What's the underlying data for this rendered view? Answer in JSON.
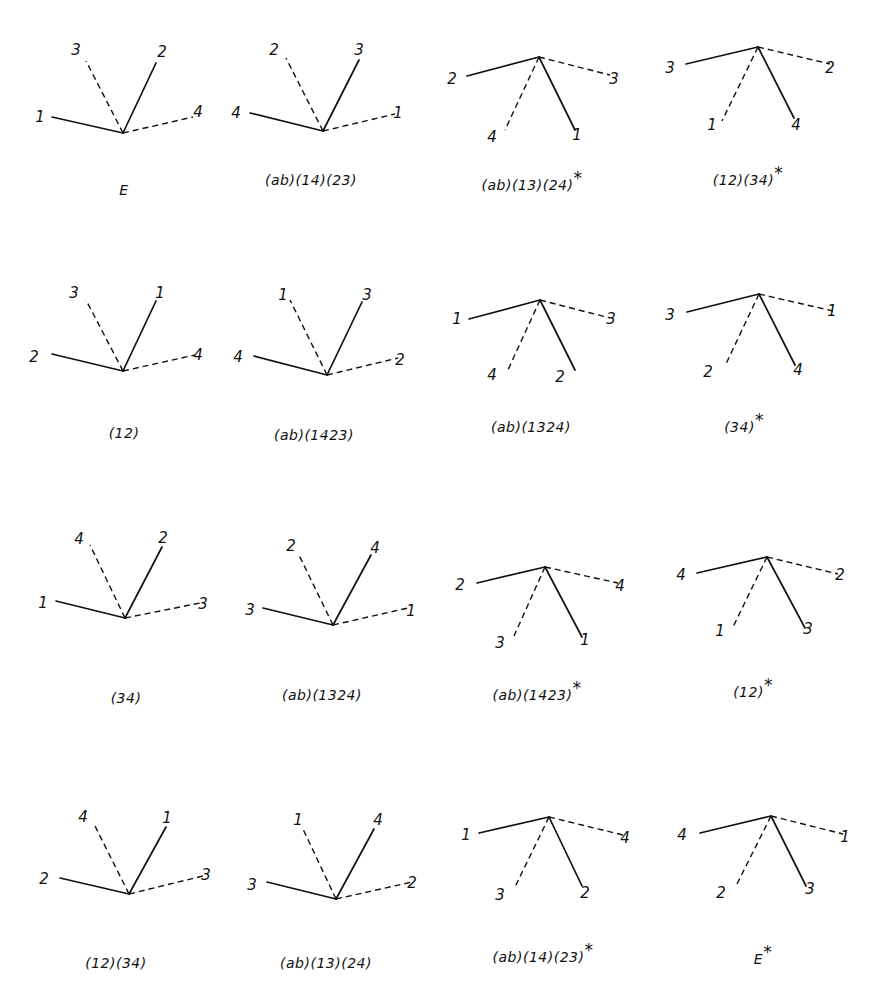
{
  "figure": {
    "layout": {
      "rows": 4,
      "cols": 4
    },
    "panels": [
      {
        "caption": "E",
        "star": false,
        "shape": "V",
        "vx": 123,
        "vy": 133,
        "arms": [
          {
            "label": "1",
            "style": "solid",
            "x": 52,
            "y": 117,
            "lx": 40,
            "ly": 122
          },
          {
            "label": "3",
            "style": "dash",
            "x": 86,
            "y": 61,
            "lx": 76,
            "ly": 55
          },
          {
            "label": "2",
            "style": "solid",
            "x": 156,
            "y": 63,
            "lx": 162,
            "ly": 57
          },
          {
            "label": "4",
            "style": "dash",
            "x": 193,
            "y": 117,
            "lx": 198,
            "ly": 117
          }
        ],
        "cx": 124,
        "cy": 195
      },
      {
        "caption": "(ab)(14)(23)",
        "star": false,
        "shape": "V",
        "vx": 323,
        "vy": 131,
        "arms": [
          {
            "label": "4",
            "style": "solid",
            "x": 250,
            "y": 113,
            "lx": 236,
            "ly": 118
          },
          {
            "label": "2",
            "style": "dash",
            "x": 286,
            "y": 58,
            "lx": 274,
            "ly": 55
          },
          {
            "label": "3",
            "style": "solid",
            "x": 359,
            "y": 60,
            "lx": 359,
            "ly": 55
          },
          {
            "label": "1",
            "style": "dash",
            "x": 395,
            "y": 114,
            "lx": 398,
            "ly": 118
          }
        ],
        "cx": 311,
        "cy": 185
      },
      {
        "caption": "(ab)(13)(24)",
        "star": true,
        "shape": "L",
        "vx": 539,
        "vy": 57,
        "arms": [
          {
            "label": "2",
            "style": "solid",
            "x": 467,
            "y": 76,
            "lx": 452,
            "ly": 84
          },
          {
            "label": "3",
            "style": "dash",
            "x": 610,
            "y": 75,
            "lx": 614,
            "ly": 84
          },
          {
            "label": "4",
            "style": "dash",
            "x": 505,
            "y": 130,
            "lx": 492,
            "ly": 142
          },
          {
            "label": "1",
            "style": "solid",
            "x": 575,
            "y": 130,
            "lx": 577,
            "ly": 140
          }
        ],
        "cx": 532,
        "cy": 190
      },
      {
        "caption": "(12)(34)",
        "star": true,
        "shape": "L",
        "vx": 758,
        "vy": 47,
        "arms": [
          {
            "label": "3",
            "style": "solid",
            "x": 686,
            "y": 64,
            "lx": 670,
            "ly": 73
          },
          {
            "label": "2",
            "style": "dash",
            "x": 830,
            "y": 64,
            "lx": 830,
            "ly": 73
          },
          {
            "label": "1",
            "style": "dash",
            "x": 722,
            "y": 121,
            "lx": 712,
            "ly": 130
          },
          {
            "label": "4",
            "style": "solid",
            "x": 794,
            "y": 118,
            "lx": 796,
            "ly": 130
          }
        ],
        "cx": 748,
        "cy": 185
      },
      {
        "caption": "(12)",
        "star": false,
        "shape": "V",
        "vx": 123,
        "vy": 371,
        "arms": [
          {
            "label": "2",
            "style": "solid",
            "x": 52,
            "y": 354,
            "lx": 34,
            "ly": 362
          },
          {
            "label": "3",
            "style": "dash",
            "x": 86,
            "y": 300,
            "lx": 74,
            "ly": 298
          },
          {
            "label": "1",
            "style": "solid",
            "x": 156,
            "y": 301,
            "lx": 160,
            "ly": 298
          },
          {
            "label": "4",
            "style": "dash",
            "x": 195,
            "y": 355,
            "lx": 198,
            "ly": 360
          }
        ],
        "cx": 124,
        "cy": 438
      },
      {
        "caption": "(ab)(1423)",
        "star": false,
        "shape": "V",
        "vx": 327,
        "vy": 375,
        "arms": [
          {
            "label": "4",
            "style": "solid",
            "x": 254,
            "y": 356,
            "lx": 238,
            "ly": 362
          },
          {
            "label": "1",
            "style": "dash",
            "x": 290,
            "y": 300,
            "lx": 283,
            "ly": 300
          },
          {
            "label": "3",
            "style": "solid",
            "x": 362,
            "y": 302,
            "lx": 367,
            "ly": 300
          },
          {
            "label": "2",
            "style": "dash",
            "x": 398,
            "y": 358,
            "lx": 400,
            "ly": 365
          }
        ],
        "cx": 314,
        "cy": 440
      },
      {
        "caption": "(ab)(1324)",
        "star": false,
        "shape": "L",
        "vx": 540,
        "vy": 300,
        "arms": [
          {
            "label": "1",
            "style": "solid",
            "x": 469,
            "y": 319,
            "lx": 457,
            "ly": 324
          },
          {
            "label": "3",
            "style": "dash",
            "x": 610,
            "y": 318,
            "lx": 611,
            "ly": 324
          },
          {
            "label": "4",
            "style": "dash",
            "x": 507,
            "y": 372,
            "lx": 492,
            "ly": 380
          },
          {
            "label": "2",
            "style": "solid",
            "x": 575,
            "y": 370,
            "lx": 560,
            "ly": 382
          }
        ],
        "cx": 531,
        "cy": 432
      },
      {
        "caption": "(34)",
        "star": true,
        "shape": "L",
        "vx": 759,
        "vy": 294,
        "arms": [
          {
            "label": "3",
            "style": "solid",
            "x": 687,
            "y": 312,
            "lx": 670,
            "ly": 320
          },
          {
            "label": "1",
            "style": "dash",
            "x": 833,
            "y": 311,
            "lx": 832,
            "ly": 316
          },
          {
            "label": "2",
            "style": "dash",
            "x": 725,
            "y": 366,
            "lx": 708,
            "ly": 377
          },
          {
            "label": "4",
            "style": "solid",
            "x": 795,
            "y": 365,
            "lx": 798,
            "ly": 375
          }
        ],
        "cx": 744,
        "cy": 432
      },
      {
        "caption": "(34)",
        "star": false,
        "shape": "V",
        "vx": 125,
        "vy": 618,
        "arms": [
          {
            "label": "1",
            "style": "solid",
            "x": 56,
            "y": 601,
            "lx": 43,
            "ly": 608
          },
          {
            "label": "4",
            "style": "dash",
            "x": 90,
            "y": 545,
            "lx": 79,
            "ly": 544
          },
          {
            "label": "2",
            "style": "solid",
            "x": 162,
            "y": 547,
            "lx": 163,
            "ly": 543
          },
          {
            "label": "3",
            "style": "dash",
            "x": 200,
            "y": 603,
            "lx": 203,
            "ly": 609
          }
        ],
        "cx": 126,
        "cy": 703
      },
      {
        "caption": "(ab)(1324)",
        "star": false,
        "shape": "V",
        "vx": 333,
        "vy": 625,
        "arms": [
          {
            "label": "3",
            "style": "solid",
            "x": 263,
            "y": 608,
            "lx": 250,
            "ly": 615
          },
          {
            "label": "2",
            "style": "dash",
            "x": 298,
            "y": 553,
            "lx": 291,
            "ly": 551
          },
          {
            "label": "4",
            "style": "solid",
            "x": 371,
            "y": 555,
            "lx": 375,
            "ly": 553
          },
          {
            "label": "1",
            "style": "dash",
            "x": 408,
            "y": 608,
            "lx": 411,
            "ly": 616
          }
        ],
        "cx": 322,
        "cy": 700
      },
      {
        "caption": "(ab)(1423)",
        "star": true,
        "shape": "L",
        "vx": 545,
        "vy": 567,
        "arms": [
          {
            "label": "2",
            "style": "solid",
            "x": 477,
            "y": 583,
            "lx": 460,
            "ly": 590
          },
          {
            "label": "4",
            "style": "dash",
            "x": 618,
            "y": 583,
            "lx": 620,
            "ly": 591
          },
          {
            "label": "3",
            "style": "dash",
            "x": 514,
            "y": 636,
            "lx": 500,
            "ly": 648
          },
          {
            "label": "1",
            "style": "solid",
            "x": 582,
            "y": 637,
            "lx": 585,
            "ly": 645
          }
        ],
        "cx": 537,
        "cy": 700
      },
      {
        "caption": "(12)",
        "star": true,
        "shape": "L",
        "vx": 767,
        "vy": 557,
        "arms": [
          {
            "label": "4",
            "style": "solid",
            "x": 697,
            "y": 573,
            "lx": 681,
            "ly": 580
          },
          {
            "label": "2",
            "style": "dash",
            "x": 838,
            "y": 574,
            "lx": 840,
            "ly": 580
          },
          {
            "label": "1",
            "style": "dash",
            "x": 733,
            "y": 627,
            "lx": 720,
            "ly": 636
          },
          {
            "label": "3",
            "style": "solid",
            "x": 805,
            "y": 628,
            "lx": 808,
            "ly": 634
          }
        ],
        "cx": 753,
        "cy": 697
      },
      {
        "caption": "(12)(34)",
        "star": false,
        "shape": "V",
        "vx": 129,
        "vy": 894,
        "arms": [
          {
            "label": "2",
            "style": "solid",
            "x": 60,
            "y": 878,
            "lx": 44,
            "ly": 884
          },
          {
            "label": "4",
            "style": "dash",
            "x": 94,
            "y": 824,
            "lx": 83,
            "ly": 822
          },
          {
            "label": "1",
            "style": "solid",
            "x": 166,
            "y": 827,
            "lx": 167,
            "ly": 823
          },
          {
            "label": "3",
            "style": "dash",
            "x": 203,
            "y": 876,
            "lx": 206,
            "ly": 880
          }
        ],
        "cx": 116,
        "cy": 968
      },
      {
        "caption": "(ab)(13)(24)",
        "star": false,
        "shape": "V",
        "vx": 336,
        "vy": 899,
        "arms": [
          {
            "label": "3",
            "style": "solid",
            "x": 267,
            "y": 882,
            "lx": 252,
            "ly": 890
          },
          {
            "label": "1",
            "style": "dash",
            "x": 302,
            "y": 827,
            "lx": 298,
            "ly": 825
          },
          {
            "label": "4",
            "style": "solid",
            "x": 374,
            "y": 829,
            "lx": 378,
            "ly": 825
          },
          {
            "label": "2",
            "style": "dash",
            "x": 412,
            "y": 882,
            "lx": 412,
            "ly": 888
          }
        ],
        "cx": 326,
        "cy": 968
      },
      {
        "caption": "(ab)(14)(23)",
        "star": true,
        "shape": "L",
        "vx": 549,
        "vy": 817,
        "arms": [
          {
            "label": "1",
            "style": "solid",
            "x": 479,
            "y": 833,
            "lx": 466,
            "ly": 840
          },
          {
            "label": "4",
            "style": "dash",
            "x": 623,
            "y": 835,
            "lx": 625,
            "ly": 843
          },
          {
            "label": "3",
            "style": "dash",
            "x": 515,
            "y": 887,
            "lx": 500,
            "ly": 900
          },
          {
            "label": "2",
            "style": "solid",
            "x": 582,
            "y": 886,
            "lx": 585,
            "ly": 898
          }
        ],
        "cx": 543,
        "cy": 962
      },
      {
        "caption": "E",
        "star": true,
        "shape": "L",
        "vx": 771,
        "vy": 816,
        "arms": [
          {
            "label": "4",
            "style": "solid",
            "x": 700,
            "y": 833,
            "lx": 682,
            "ly": 840
          },
          {
            "label": "1",
            "style": "dash",
            "x": 843,
            "y": 834,
            "lx": 845,
            "ly": 842
          },
          {
            "label": "2",
            "style": "dash",
            "x": 736,
            "y": 886,
            "lx": 721,
            "ly": 898
          },
          {
            "label": "3",
            "style": "solid",
            "x": 806,
            "y": 886,
            "lx": 810,
            "ly": 894
          }
        ],
        "cx": 763,
        "cy": 964
      }
    ]
  }
}
